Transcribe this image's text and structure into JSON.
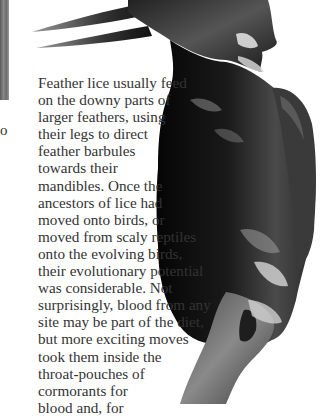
{
  "page": {
    "background": "#ffffff",
    "text_color": "#333333"
  },
  "figure": {
    "left_photo_fragment": "grayscale-photo-edge"
  },
  "stray_glyph": "o",
  "body_text": {
    "lines": [
      "Feather lice usually feed",
      "on the downy parts of",
      "larger feathers, using",
      "their legs to direct",
      "feather barbules",
      "towards their",
      "mandibles. Once the",
      "ancestors of lice had",
      "moved onto birds, or",
      "moved from scaly reptiles",
      "onto the evolving birds,",
      "their evolutionary potential",
      "was considerable. Not",
      "surprisingly, blood from any",
      "site may be part of the diet,",
      "but more exciting moves",
      "took them inside the",
      "throat-pouches of",
      "cormorants for",
      "blood and, for"
    ]
  }
}
